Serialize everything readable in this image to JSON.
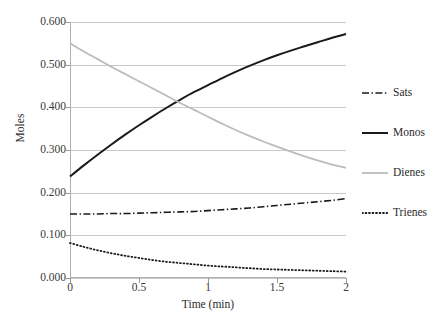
{
  "chart_data": {
    "type": "line",
    "title": "",
    "xlabel": "Time (min)",
    "ylabel": "Moles",
    "xlim": [
      0,
      2
    ],
    "ylim": [
      0,
      0.6
    ],
    "grid": "horizontal",
    "legend_position": "right",
    "xticks": [
      "0",
      "0.5",
      "1",
      "1.5",
      "2"
    ],
    "xtick_values": [
      0,
      0.5,
      1,
      1.5,
      2
    ],
    "yticks": [
      "0.000",
      "0.100",
      "0.200",
      "0.300",
      "0.400",
      "0.500",
      "0.600"
    ],
    "ytick_values": [
      0.0,
      0.1,
      0.2,
      0.3,
      0.4,
      0.5,
      0.6
    ],
    "x": [
      0,
      0.1,
      0.2,
      0.3,
      0.4,
      0.5,
      0.6,
      0.7,
      0.8,
      0.9,
      1.0,
      1.1,
      1.2,
      1.3,
      1.4,
      1.5,
      1.6,
      1.7,
      1.8,
      1.9,
      2.0
    ],
    "series": [
      {
        "name": "Sats",
        "style": "dashdot",
        "color": "#1a1a1a",
        "width": 1.6,
        "values": [
          0.15,
          0.15,
          0.15,
          0.151,
          0.151,
          0.152,
          0.153,
          0.154,
          0.155,
          0.156,
          0.158,
          0.16,
          0.162,
          0.164,
          0.167,
          0.17,
          0.173,
          0.176,
          0.179,
          0.182,
          0.186
        ]
      },
      {
        "name": "Monos",
        "style": "solid",
        "color": "#1a1a1a",
        "width": 2.0,
        "values": [
          0.238,
          0.264,
          0.289,
          0.313,
          0.336,
          0.358,
          0.379,
          0.399,
          0.418,
          0.436,
          0.452,
          0.468,
          0.483,
          0.497,
          0.51,
          0.522,
          0.533,
          0.543,
          0.553,
          0.563,
          0.572
        ]
      },
      {
        "name": "Dienes",
        "style": "solid",
        "color": "#bcbcbc",
        "width": 1.8,
        "values": [
          0.55,
          0.531,
          0.513,
          0.495,
          0.478,
          0.461,
          0.444,
          0.427,
          0.41,
          0.394,
          0.378,
          0.362,
          0.347,
          0.333,
          0.32,
          0.308,
          0.296,
          0.285,
          0.275,
          0.266,
          0.258
        ]
      },
      {
        "name": "Trienes",
        "style": "dotted",
        "color": "#1a1a1a",
        "width": 1.8,
        "values": [
          0.082,
          0.073,
          0.065,
          0.058,
          0.052,
          0.047,
          0.042,
          0.038,
          0.035,
          0.032,
          0.029,
          0.027,
          0.025,
          0.023,
          0.021,
          0.02,
          0.019,
          0.018,
          0.017,
          0.016,
          0.015
        ]
      }
    ]
  },
  "legend": {
    "items": [
      {
        "label": "Sats"
      },
      {
        "label": "Monos"
      },
      {
        "label": "Dienes"
      },
      {
        "label": "Trienes"
      }
    ]
  }
}
